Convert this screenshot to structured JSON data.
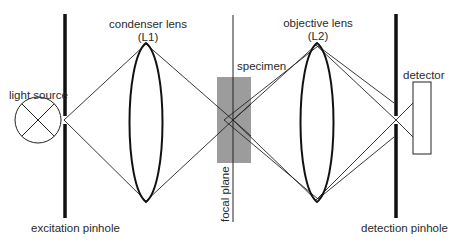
{
  "labels": {
    "light_source": "light source",
    "condenser_lens": "condenser lens",
    "condenser_lens_id": "(L1)",
    "specimen": "specimen",
    "objective_lens": "objective lens",
    "objective_lens_id": "(L2)",
    "detector": "detector",
    "focal_plane": "focal plane",
    "excitation_pinhole": "excitation pinhole",
    "detection_pinhole": "detection pinhole"
  },
  "colors": {
    "ink": "#1a1a1a",
    "specimen_fill": "#9a9a9a",
    "background": "#ffffff"
  }
}
